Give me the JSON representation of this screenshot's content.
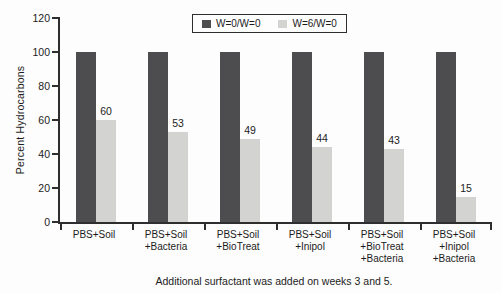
{
  "chart_data": {
    "type": "bar",
    "title": "",
    "xlabel": "",
    "ylabel": "Percent Hydrocarbons",
    "caption": "Additional surfactant was added on weeks 3 and 5.",
    "ylim": [
      0,
      120
    ],
    "yticks": [
      0,
      20,
      40,
      60,
      80,
      100,
      120
    ],
    "grid": false,
    "legend_position": "top-center",
    "categories": [
      "PBS+Soil",
      "PBS+Soil\n+Bacteria",
      "PBS+Soil\n+BioTreat",
      "PBS+Soil\n+Inipol",
      "PBS+Soil\n+BioTreat\n+Bacteria",
      "PBS+Soil\n+Inipol\n+Bacteria"
    ],
    "series": [
      {
        "name": "W=0/W=0",
        "color": "#4d4d4f",
        "values": [
          100,
          100,
          100,
          100,
          100,
          100
        ],
        "value_labels_shown": false
      },
      {
        "name": "W=6/W=0",
        "color": "#d3d3d1",
        "values": [
          60,
          53,
          49,
          44,
          43,
          15
        ],
        "value_labels_shown": true
      }
    ]
  },
  "colors": {
    "axis": "#2e2e2e",
    "text": "#1c1c1c",
    "background": "#fdfdfd",
    "legend_border": "#2e2e2e"
  }
}
